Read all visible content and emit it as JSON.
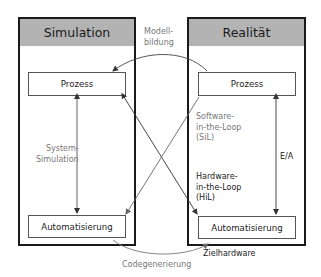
{
  "diagram": {
    "left_panel": {
      "title": "Simulation",
      "top_box": "Prozess",
      "bottom_box": "Automatisierung",
      "vertical_link_label": "System-\nSimulation"
    },
    "right_panel": {
      "title": "Realität",
      "top_box": "Prozess",
      "bottom_box": "Automatisierung",
      "vertical_link_label": "E/A",
      "below_label": "Zielhardware"
    },
    "cross_links": {
      "sil_label": "Software-\nin-the-Loop\n(SiL)",
      "hil_label": "Hardware-\nin-the-Loop\n(HiL)"
    },
    "top_arc_label": "Modell-\nbildung",
    "bottom_arc_label": "Codegenerierung",
    "colors": {
      "header_fill": "#b3b3b3",
      "border": "#1a1a1a",
      "gray_text": "#777777",
      "dark_text": "#222222"
    }
  }
}
